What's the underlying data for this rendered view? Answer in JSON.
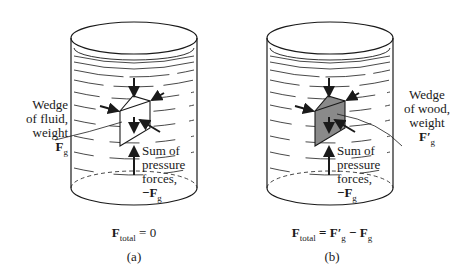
{
  "figure": {
    "panel_a": {
      "caption": "(a)",
      "wedge_label": [
        "Wedge",
        "of fluid,",
        "weight"
      ],
      "wedge_weight_symbol": "F",
      "wedge_weight_sub": "g",
      "pressure_label": [
        "Sum of",
        "pressure",
        "forces,"
      ],
      "pressure_symbol": "−F",
      "pressure_sub": "g",
      "equation_lhs": "F",
      "equation_lhs_sub": "total",
      "equation_rhs": " = 0",
      "wedge_fill": "#ffffff"
    },
    "panel_b": {
      "caption": "(b)",
      "wedge_label": [
        "Wedge",
        "of wood,",
        "weight"
      ],
      "wedge_weight_symbol": "F′",
      "wedge_weight_sub": "g",
      "pressure_label": [
        "Sum of",
        "pressure",
        "forces,"
      ],
      "pressure_symbol": "−F",
      "pressure_sub": "g",
      "equation_lhs": "F",
      "equation_lhs_sub": "total",
      "equation_rhs_1": " = F′",
      "equation_rhs_1_sub": "g",
      "equation_rhs_2": " − F",
      "equation_rhs_2_sub": "g",
      "wedge_fill": "#8a8a8a"
    }
  }
}
